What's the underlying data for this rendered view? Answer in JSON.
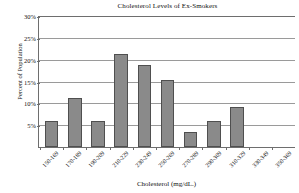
{
  "chart_data": {
    "type": "bar",
    "title": "Cholesterol Levels of Ex-Smokers",
    "xlabel": "Cholesterol (mg/dL.)",
    "ylabel": "Percent of Population",
    "categories": [
      "150-169",
      "170-189",
      "190-209",
      "210-229",
      "230-249",
      "250-269",
      "270-289",
      "290-309",
      "310-329",
      "330-349",
      "350-369"
    ],
    "values": [
      6.0,
      11.3,
      6.0,
      21.2,
      18.7,
      15.4,
      3.4,
      5.9,
      9.2,
      0,
      0
    ],
    "ylim": [
      0,
      30
    ],
    "yticks": [
      5,
      10,
      15,
      20,
      25,
      30
    ],
    "ytick_labels": [
      "5%",
      "10%",
      "15%",
      "20%",
      "25%",
      "30%"
    ],
    "grid": true,
    "legend": false,
    "bar_color": "#8a8a8a",
    "bar_border_color": "#4f4f4f",
    "axis_color": "#6e6e6e",
    "grid_color": "#9a9a9a"
  }
}
